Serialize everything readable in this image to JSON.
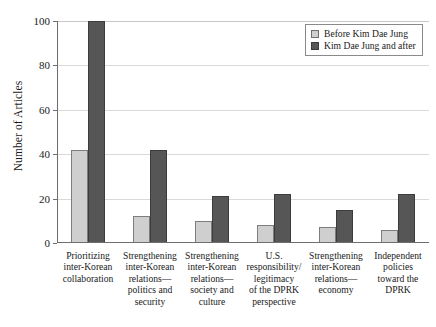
{
  "chart_data": {
    "type": "bar",
    "title": "",
    "subtitle": "",
    "xlabel": "",
    "ylabel": "Number of Articles",
    "ylim": [
      0,
      100
    ],
    "yticks": [
      0,
      20,
      40,
      60,
      80,
      100
    ],
    "grid": true,
    "legend_position": "top-right",
    "categories": [
      "Prioritizing inter-Korean collaboration",
      "Strengthening inter-Korean relations—politics and security",
      "Strengthening inter-Korean relations—society and culture",
      "U.S. responsibility/ legitimacy of the DPRK perspective",
      "Strengthening inter-Korean relations—economy",
      "Independent policies toward the DPRK"
    ],
    "category_lines": [
      [
        "Prioritizing",
        "inter-Korean",
        "collaboration"
      ],
      [
        "Strengthening",
        "inter-Korean",
        "relations—",
        "politics and",
        "security"
      ],
      [
        "Strengthening",
        "inter-Korean",
        "relations—",
        "society and",
        "culture"
      ],
      [
        "U.S.",
        "responsibility/",
        "legitimacy",
        "of the DPRK",
        "perspective"
      ],
      [
        "Strengthening",
        "inter-Korean",
        "relations—",
        "economy"
      ],
      [
        "Independent",
        "policies",
        "toward the",
        "DPRK"
      ]
    ],
    "series": [
      {
        "name": "Before Kim Dae Jung",
        "color": "#cfcfcf",
        "values": [
          42,
          12,
          10,
          8,
          7,
          6
        ]
      },
      {
        "name": "Kim Dae Jung and after",
        "color": "#565656",
        "values": [
          100,
          42,
          21,
          22,
          15,
          22
        ]
      }
    ]
  },
  "legend": {
    "items": [
      {
        "label": "Before Kim Dae Jung",
        "swatch": "before"
      },
      {
        "label": "Kim Dae Jung and after",
        "swatch": "after"
      }
    ]
  }
}
